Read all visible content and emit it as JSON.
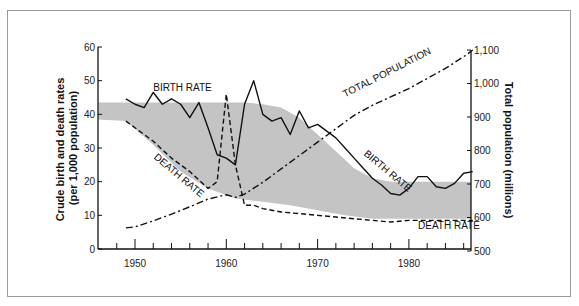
{
  "chart_data": {
    "type": "line",
    "title": "",
    "xlabel": "",
    "ylabel": "Crude birth and death rates (per 1,000 population)",
    "ylabel_right": "Total population (millions)",
    "xlim": [
      1946,
      1987
    ],
    "ylim": [
      0,
      60
    ],
    "ylim_right": [
      500,
      1100
    ],
    "x_ticks": [
      1950,
      1960,
      1970,
      1980
    ],
    "y_ticks": [
      0,
      10,
      20,
      30,
      40,
      50,
      60
    ],
    "y_ticks_right": [
      "500",
      "600",
      "700",
      "800",
      "900",
      "1,000",
      "1,100"
    ],
    "grid": false,
    "series": [
      {
        "name": "BIRTH RATE",
        "style": "solid",
        "axis": "left",
        "x": [
          1949,
          1950,
          1951,
          1952,
          1953,
          1954,
          1955,
          1956,
          1957,
          1958,
          1959,
          1960,
          1961,
          1962,
          1963,
          1964,
          1965,
          1966,
          1967,
          1968,
          1969,
          1970,
          1971,
          1972,
          1973,
          1974,
          1975,
          1976,
          1977,
          1978,
          1979,
          1980,
          1981,
          1982,
          1983,
          1984,
          1985,
          1986,
          1987
        ],
        "values": [
          44.6,
          43,
          42,
          46.5,
          43,
          44.6,
          43,
          39,
          43.5,
          36,
          28,
          27,
          25,
          43,
          50,
          40,
          38,
          39,
          34,
          41,
          36,
          37,
          35,
          33,
          30,
          27,
          24,
          21,
          19,
          16.5,
          16,
          18,
          21.5,
          21.5,
          18.5,
          18,
          19.5,
          22.5,
          23
        ]
      },
      {
        "name": "DEATH RATE",
        "style": "dashed",
        "axis": "left",
        "x": [
          1949,
          1950,
          1952,
          1954,
          1956,
          1958,
          1959,
          1960,
          1961,
          1962,
          1963,
          1964,
          1966,
          1968,
          1970,
          1972,
          1974,
          1976,
          1978,
          1980,
          1982,
          1984,
          1986,
          1987
        ],
        "values": [
          38,
          36,
          32,
          27,
          23,
          18,
          20,
          46,
          25,
          13,
          13,
          12,
          11,
          10.5,
          10,
          9.5,
          9,
          8.5,
          8,
          8.5,
          8.5,
          8.5,
          8.5,
          8.5
        ]
      },
      {
        "name": "TOTAL POPULATION",
        "style": "dash-dot",
        "axis": "right",
        "x": [
          1949,
          1950,
          1952,
          1954,
          1956,
          1958,
          1960,
          1961,
          1962,
          1964,
          1966,
          1968,
          1970,
          1972,
          1974,
          1976,
          1978,
          1980,
          1982,
          1984,
          1986,
          1987
        ],
        "values": [
          569,
          572,
          590,
          610,
          632,
          655,
          668,
          660,
          670,
          705,
          745,
          785,
          825,
          865,
          905,
          935,
          960,
          985,
          1015,
          1045,
          1080,
          1100
        ]
      }
    ],
    "shaded_band": {
      "description": "Gray band indicating demographic transition envelope",
      "upper": {
        "x": [
          1946,
          1962,
          1964,
          1966,
          1968,
          1970,
          1972,
          1974,
          1976,
          1978,
          1987
        ],
        "values": [
          43.5,
          43.5,
          43,
          42,
          39,
          34,
          29,
          24,
          21,
          20,
          20
        ]
      },
      "lower": {
        "x": [
          1946,
          1949,
          1952,
          1955,
          1958,
          1961,
          1964,
          1967,
          1970,
          1973,
          1976,
          1979,
          1987
        ],
        "values": [
          38.5,
          38,
          31,
          23,
          18,
          15,
          14,
          13,
          11.5,
          10,
          9,
          9,
          9
        ]
      }
    },
    "annotations": [
      {
        "text": "BIRTH RATE",
        "x": 1952,
        "y": 47,
        "rotate": 0
      },
      {
        "text": "DEATH RATE",
        "x": 1952,
        "y": 27,
        "rotate": 40
      },
      {
        "text": "TOTAL POPULATION",
        "x": 1973,
        "y": 45,
        "rotate": -27
      },
      {
        "text": "BIRTH RATE",
        "x": 1975,
        "y": 28,
        "rotate": 40
      },
      {
        "text": "DEATH RATE",
        "x": 1981,
        "y": 6,
        "rotate": 0
      }
    ],
    "colors": {
      "band": "#c4c4c4",
      "line": "#111111",
      "axis": "#111111",
      "frame": "#9a9a9a"
    }
  }
}
